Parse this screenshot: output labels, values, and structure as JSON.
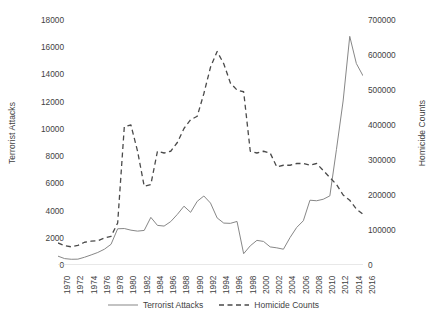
{
  "chart_data": {
    "type": "line",
    "title": "",
    "xlabel": "",
    "x": [
      1970,
      1971,
      1972,
      1973,
      1974,
      1975,
      1976,
      1977,
      1978,
      1979,
      1980,
      1981,
      1982,
      1983,
      1984,
      1985,
      1986,
      1987,
      1988,
      1989,
      1990,
      1991,
      1992,
      1993,
      1994,
      1995,
      1996,
      1997,
      1998,
      1999,
      2000,
      2001,
      2002,
      2003,
      2004,
      2005,
      2006,
      2007,
      2008,
      2009,
      2010,
      2011,
      2012,
      2013,
      2014,
      2015,
      2016
    ],
    "xtick_labels": [
      "1970",
      "1972",
      "1974",
      "1976",
      "1978",
      "1980",
      "1982",
      "1984",
      "1986",
      "1988",
      "1990",
      "1992",
      "1994",
      "1996",
      "1998",
      "2000",
      "2002",
      "2004",
      "2006",
      "2008",
      "2010",
      "2012",
      "2014",
      "2016"
    ],
    "grid": false,
    "legend_position": "bottom",
    "series": [
      {
        "name": "Terrorist Attacks",
        "axis": "left",
        "style": "solid",
        "color": "#878787",
        "ylabel": "Terrorist Attacks",
        "ylim": [
          0,
          18000
        ],
        "yticks": [
          0,
          2000,
          4000,
          6000,
          8000,
          10000,
          12000,
          14000,
          16000,
          18000
        ],
        "values": [
          650,
          470,
          420,
          430,
          570,
          740,
          920,
          1160,
          1520,
          2660,
          2680,
          2560,
          2490,
          2540,
          3500,
          2910,
          2860,
          3190,
          3720,
          4320,
          3870,
          4680,
          5070,
          4550,
          3460,
          3080,
          3060,
          3200,
          830,
          1410,
          1810,
          1730,
          1330,
          1260,
          1160,
          2020,
          2760,
          3250,
          4760,
          4720,
          4830,
          5080,
          8500,
          12050,
          16800,
          14800,
          13900
        ]
      },
      {
        "name": "Homicide Counts",
        "axis": "right",
        "style": "dashed",
        "color": "#4a4a4a",
        "ylabel": "Homicide Counts",
        "ylim": [
          0,
          700000
        ],
        "yticks": [
          0,
          100000,
          200000,
          300000,
          400000,
          500000,
          600000,
          700000
        ],
        "values": [
          63000,
          55000,
          52000,
          56000,
          65000,
          68000,
          69000,
          77000,
          82000,
          120000,
          395000,
          400000,
          325000,
          225000,
          230000,
          325000,
          320000,
          325000,
          350000,
          390000,
          415000,
          425000,
          490000,
          565000,
          610000,
          575000,
          520000,
          500000,
          495000,
          325000,
          320000,
          325000,
          320000,
          280000,
          285000,
          285000,
          290000,
          290000,
          285000,
          290000,
          270000,
          250000,
          230000,
          200000,
          185000,
          160000,
          145000
        ]
      }
    ]
  },
  "legend": {
    "entries": [
      {
        "label": "Terrorist Attacks",
        "style": "solid"
      },
      {
        "label": "Homicide Counts",
        "style": "dashed"
      }
    ]
  }
}
